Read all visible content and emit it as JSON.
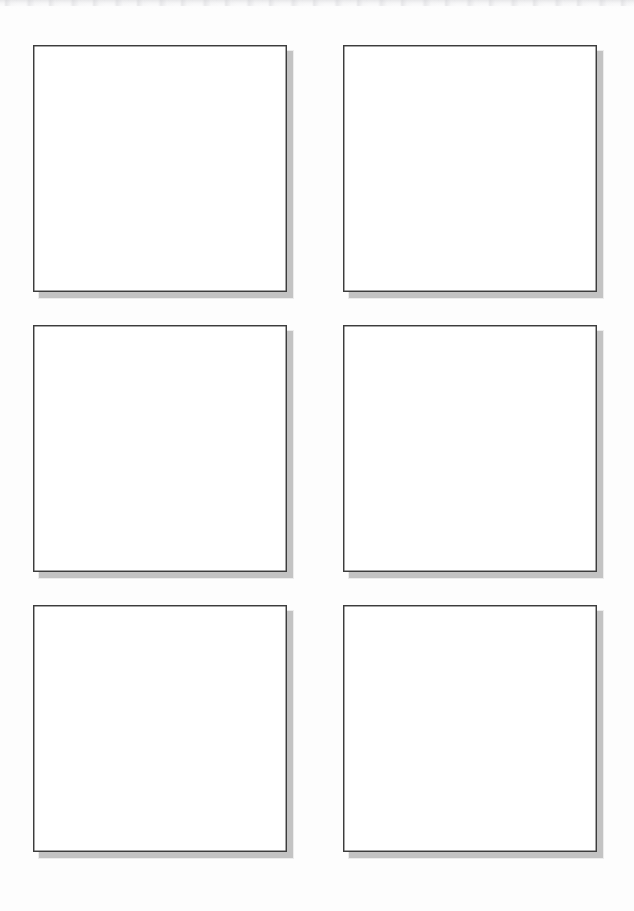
{
  "page": {
    "background_color": "#fdfdfd",
    "width": 634,
    "height": 911
  },
  "artifact": {
    "name": "scan-edge-band",
    "description": "",
    "color": "#e4e4e6"
  },
  "grid": {
    "columns": 2,
    "rows": 3,
    "panel_border_color": "#3c3c3c",
    "panel_fill_color": "#ffffff",
    "shadow_color": "#bcbcbc",
    "shadow_offset_px": 6,
    "panels": [
      {
        "id": "panel-1",
        "label": "",
        "row": 1,
        "column": 1,
        "x": 33,
        "y": 45,
        "width": 254,
        "height": 247
      },
      {
        "id": "panel-2",
        "label": "",
        "row": 1,
        "column": 2,
        "x": 343,
        "y": 45,
        "width": 254,
        "height": 247
      },
      {
        "id": "panel-3",
        "label": "",
        "row": 2,
        "column": 1,
        "x": 33,
        "y": 325,
        "width": 254,
        "height": 247
      },
      {
        "id": "panel-4",
        "label": "",
        "row": 2,
        "column": 2,
        "x": 343,
        "y": 325,
        "width": 254,
        "height": 247
      },
      {
        "id": "panel-5",
        "label": "",
        "row": 3,
        "column": 1,
        "x": 33,
        "y": 605,
        "width": 254,
        "height": 247
      },
      {
        "id": "panel-6",
        "label": "",
        "row": 3,
        "column": 2,
        "x": 343,
        "y": 605,
        "width": 254,
        "height": 247
      }
    ]
  }
}
